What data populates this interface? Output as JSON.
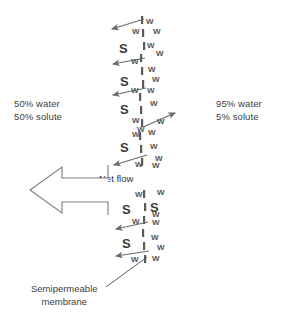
{
  "figure": {
    "background_color": "#ffffff",
    "ink_color": "#4a4a4a",
    "width": 291,
    "height": 322
  },
  "left_side": {
    "line1": "50% water",
    "line2": "50% solute",
    "x": 14,
    "y": 98
  },
  "right_side": {
    "line1": "95% water",
    "line2": "5% solute",
    "x": 216,
    "y": 98
  },
  "net_flow": {
    "label": "Net flow",
    "direction": "left",
    "label_x": 99,
    "label_y": 173
  },
  "membrane_caption": {
    "line1": "Semipermeable",
    "line2": "membrane"
  },
  "membrane": {
    "color": "#5a5a5a",
    "segments": [
      {
        "x": 141,
        "y": 16,
        "h": 8
      },
      {
        "x": 142,
        "y": 29,
        "h": 8
      },
      {
        "x": 143,
        "y": 42,
        "h": 8
      },
      {
        "x": 140,
        "y": 54,
        "h": 8
      },
      {
        "x": 141,
        "y": 67,
        "h": 8
      },
      {
        "x": 142,
        "y": 80,
        "h": 8
      },
      {
        "x": 139,
        "y": 93,
        "h": 8
      },
      {
        "x": 140,
        "y": 106,
        "h": 8
      },
      {
        "x": 141,
        "y": 119,
        "h": 8
      },
      {
        "x": 139,
        "y": 132,
        "h": 8
      },
      {
        "x": 140,
        "y": 145,
        "h": 8
      },
      {
        "x": 141,
        "y": 158,
        "h": 8
      },
      {
        "x": 143,
        "y": 190,
        "h": 8
      },
      {
        "x": 144,
        "y": 203,
        "h": 8
      },
      {
        "x": 143,
        "y": 216,
        "h": 8
      },
      {
        "x": 142,
        "y": 229,
        "h": 8
      },
      {
        "x": 143,
        "y": 242,
        "h": 8
      },
      {
        "x": 144,
        "y": 255,
        "h": 8
      }
    ]
  },
  "molecules": [
    {
      "type": "W",
      "x": 146,
      "y": 18
    },
    {
      "type": "W",
      "x": 132,
      "y": 28
    },
    {
      "type": "W",
      "x": 153,
      "y": 28
    },
    {
      "type": "S",
      "x": 119,
      "y": 42
    },
    {
      "type": "W",
      "x": 147,
      "y": 42
    },
    {
      "type": "W",
      "x": 156,
      "y": 50
    },
    {
      "type": "W",
      "x": 131,
      "y": 58
    },
    {
      "type": "W",
      "x": 148,
      "y": 66
    },
    {
      "type": "S",
      "x": 120,
      "y": 75
    },
    {
      "type": "W",
      "x": 152,
      "y": 76
    },
    {
      "type": "W",
      "x": 131,
      "y": 87
    },
    {
      "type": "W",
      "x": 147,
      "y": 87
    },
    {
      "type": "W",
      "x": 150,
      "y": 100
    },
    {
      "type": "S",
      "x": 120,
      "y": 103
    },
    {
      "type": "W",
      "x": 132,
      "y": 117
    },
    {
      "type": "W",
      "x": 157,
      "y": 118
    },
    {
      "type": "W",
      "x": 137,
      "y": 126
    },
    {
      "type": "W",
      "x": 148,
      "y": 129
    },
    {
      "type": "W",
      "x": 132,
      "y": 131
    },
    {
      "type": "S",
      "x": 120,
      "y": 141
    },
    {
      "type": "W",
      "x": 150,
      "y": 143
    },
    {
      "type": "W",
      "x": 155,
      "y": 155
    },
    {
      "type": "W",
      "x": 135,
      "y": 161
    },
    {
      "type": "W",
      "x": 152,
      "y": 162
    },
    {
      "type": "W",
      "x": 135,
      "y": 191
    },
    {
      "type": "W",
      "x": 157,
      "y": 189
    },
    {
      "type": "S",
      "x": 122,
      "y": 203
    },
    {
      "type": "S",
      "x": 150,
      "y": 201
    },
    {
      "type": "W",
      "x": 152,
      "y": 211
    },
    {
      "type": "W",
      "x": 132,
      "y": 218
    },
    {
      "type": "W",
      "x": 152,
      "y": 219
    },
    {
      "type": "S",
      "x": 122,
      "y": 237
    },
    {
      "type": "W",
      "x": 151,
      "y": 234
    },
    {
      "type": "W",
      "x": 157,
      "y": 244
    },
    {
      "type": "W",
      "x": 131,
      "y": 256
    },
    {
      "type": "W",
      "x": 152,
      "y": 255
    }
  ],
  "small_arrows": [
    {
      "name": "arrow-left-1",
      "x1": 144,
      "y1": 19,
      "x2": 112,
      "y2": 29,
      "dir": "left"
    },
    {
      "name": "arrow-left-2",
      "x1": 145,
      "y1": 58,
      "x2": 113,
      "y2": 64,
      "dir": "left"
    },
    {
      "name": "arrow-left-3",
      "x1": 146,
      "y1": 88,
      "x2": 113,
      "y2": 95,
      "dir": "left"
    },
    {
      "name": "arrow-right-1",
      "x1": 143,
      "y1": 127,
      "x2": 175,
      "y2": 113,
      "dir": "right"
    },
    {
      "name": "arrow-left-4",
      "x1": 147,
      "y1": 155,
      "x2": 114,
      "y2": 165,
      "dir": "left"
    },
    {
      "name": "arrow-left-5",
      "x1": 148,
      "y1": 222,
      "x2": 116,
      "y2": 229,
      "dir": "left"
    },
    {
      "name": "arrow-left-6",
      "x1": 149,
      "y1": 251,
      "x2": 116,
      "y2": 256,
      "dir": "left"
    }
  ],
  "leader_line": {
    "from_x": 106,
    "from_y": 287,
    "to_x": 147,
    "to_y": 257
  }
}
